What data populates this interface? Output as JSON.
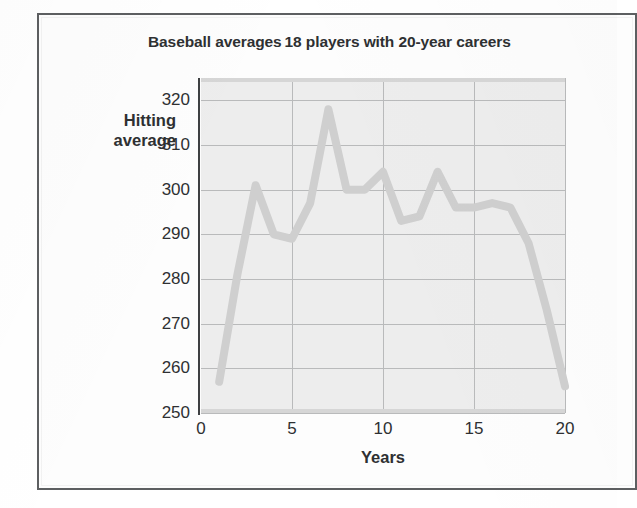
{
  "figure": {
    "title": "Baseball averages 18 players with 20-year careers",
    "y_axis_title_line1": "Hitting",
    "y_axis_title_line2": "average",
    "x_axis_title": "Years",
    "plot_background_color": "#ededed",
    "line_color": "#cfcfcf",
    "gridline_color": "#b9babb",
    "frame_color": "#5d5f61",
    "text_color": "#2e3032"
  },
  "axes": {
    "y_ticks": [
      "250",
      "260",
      "270",
      "280",
      "290",
      "300",
      "310",
      "320"
    ],
    "x_ticks": [
      "0",
      "5",
      "10",
      "15",
      "20"
    ]
  },
  "chart_data": {
    "type": "line",
    "title": "Baseball averages 18 players with 20-year careers",
    "xlabel": "Years",
    "ylabel": "Hitting average",
    "xlim": [
      0,
      20
    ],
    "ylim": [
      250,
      325
    ],
    "yticks": [
      250,
      260,
      270,
      280,
      290,
      300,
      310,
      320
    ],
    "xticks": [
      0,
      5,
      10,
      15,
      20
    ],
    "grid": true,
    "legend": "none",
    "series": [
      {
        "name": "Hitting average",
        "x": [
          1,
          2,
          3,
          4,
          5,
          6,
          7,
          8,
          9,
          10,
          11,
          12,
          13,
          14,
          15,
          16,
          17,
          18,
          19,
          20
        ],
        "values": [
          257,
          281,
          301,
          290,
          289,
          297,
          318,
          300,
          300,
          304,
          293,
          294,
          304,
          296,
          296,
          297,
          296,
          288,
          273,
          256
        ]
      }
    ]
  }
}
